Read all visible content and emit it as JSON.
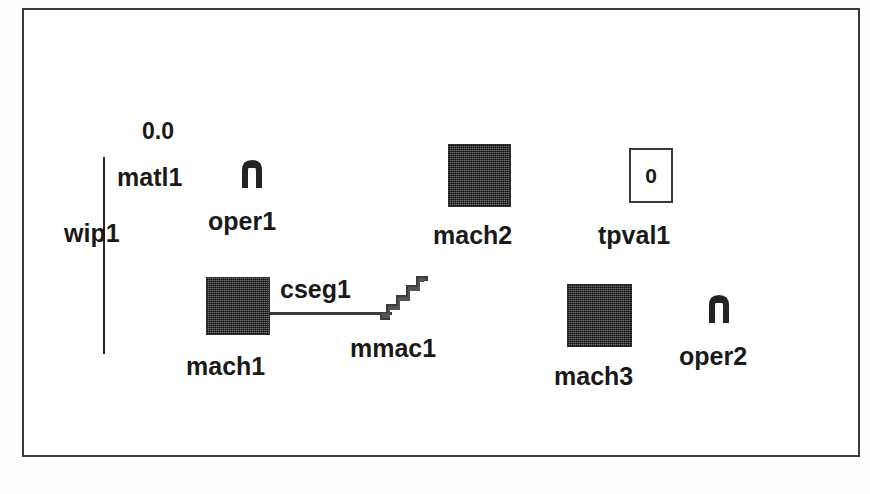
{
  "diagram": {
    "background_color": "#ffffff",
    "frame_color": "#3b3b3b",
    "machine_fill_color": "#4a4a4a",
    "line_color": "#3a3a3a",
    "text_color": "#1a1a1a"
  },
  "nodes": [
    {
      "id": "wip1",
      "label": "wip1",
      "type": "buffer-line",
      "value_label": "0.0"
    },
    {
      "id": "matl1",
      "label": "matl1",
      "type": "material-label"
    },
    {
      "id": "oper1",
      "label": "oper1",
      "type": "operator",
      "icon": "operator-arch-icon"
    },
    {
      "id": "mach2",
      "label": "mach2",
      "type": "machine",
      "icon": "machine-square-icon"
    },
    {
      "id": "tpval1",
      "label": "tpval1",
      "type": "value-box",
      "value": "0",
      "icon": "value-box-icon"
    },
    {
      "id": "mach1",
      "label": "mach1",
      "type": "machine",
      "icon": "machine-square-icon"
    },
    {
      "id": "cseg1",
      "label": "cseg1",
      "type": "conveyor-segment"
    },
    {
      "id": "mmac1",
      "label": "mmac1",
      "type": "multi-machine",
      "icon": "staircase-icon"
    },
    {
      "id": "mach3",
      "label": "mach3",
      "type": "machine",
      "icon": "machine-square-icon"
    },
    {
      "id": "oper2",
      "label": "oper2",
      "type": "operator",
      "icon": "operator-arch-icon"
    }
  ],
  "labels": {
    "wip_value": "0.0",
    "wip1": "wip1",
    "matl1": "matl1",
    "oper1": "oper1",
    "mach2": "mach2",
    "tpval1": "tpval1",
    "tpval1_value": "0",
    "mach1": "mach1",
    "cseg1": "cseg1",
    "mmac1": "mmac1",
    "mach3": "mach3",
    "oper2": "oper2"
  }
}
